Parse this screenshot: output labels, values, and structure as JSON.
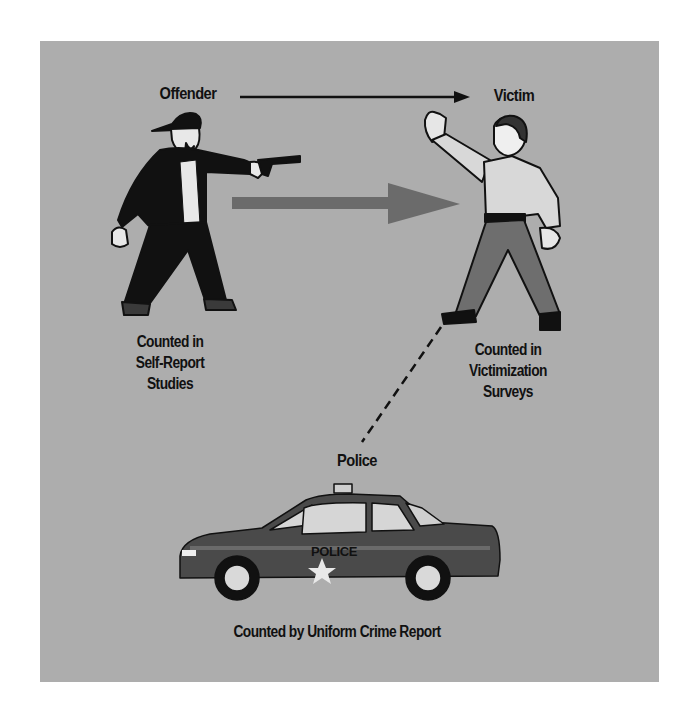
{
  "diagram": {
    "type": "crime-measurement-flow",
    "nodes": {
      "offender": {
        "label": "Offender",
        "caption_lines": [
          "Counted in",
          "Self-Report",
          "Studies"
        ]
      },
      "victim": {
        "label": "Victim",
        "caption_lines": [
          "Counted in",
          "Victimization",
          "Surveys"
        ]
      },
      "police": {
        "label": "Police",
        "caption": "Counted by Uniform Crime Report",
        "car_text": "POLICE"
      }
    },
    "edges": [
      {
        "from": "Offender",
        "to": "Victim",
        "style": "thin-solid-arrow"
      },
      {
        "from": "Offender",
        "to": "Victim",
        "style": "thick-gray-arrow"
      },
      {
        "from": "Victim",
        "to": "Police",
        "style": "dashed-line"
      }
    ],
    "colors": {
      "panel": "#adadad",
      "thick_arrow": "#6b6b6b",
      "ink": "#111111",
      "car_body": "#4a4a4a",
      "shirt": "#d8d8d8",
      "pants": "#6e6e6e"
    }
  }
}
